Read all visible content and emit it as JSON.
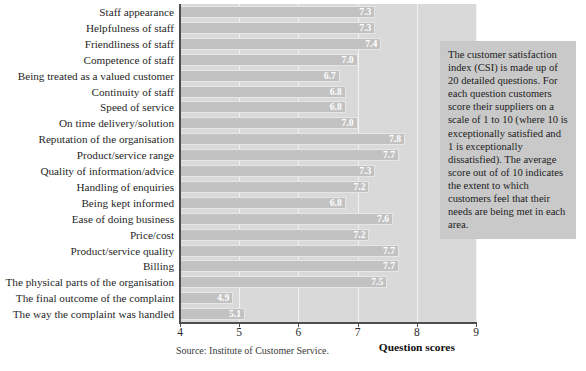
{
  "chart_data": {
    "type": "bar",
    "orientation": "horizontal",
    "title": "",
    "xlabel": "Question scores",
    "ylabel": "",
    "xlim": [
      4,
      9
    ],
    "xticks": [
      4,
      5,
      6,
      7,
      8,
      9
    ],
    "xtick_labels": [
      "4",
      "5",
      "6",
      "7",
      "8",
      "9"
    ],
    "grid": true,
    "legend": null,
    "categories": [
      "Staff appearance",
      "Helpfulness of staff",
      "Friendliness of staff",
      "Competence of staff",
      "Being treated as a valued customer",
      "Continuity of staff",
      "Speed of service",
      "On time delivery/solution",
      "Reputation of the organisation",
      "Product/service range",
      "Quality of information/advice",
      "Handling of enquiries",
      "Being kept informed",
      "Ease of doing business",
      "Price/cost",
      "Product/service quality",
      "Billing",
      "The physical parts of the organisation",
      "The final outcome of the complaint",
      "The way the complaint was handled"
    ],
    "values": [
      7.3,
      7.3,
      7.4,
      7.0,
      6.7,
      6.8,
      6.8,
      7.0,
      7.8,
      7.7,
      7.3,
      7.2,
      6.8,
      7.6,
      7.2,
      7.7,
      7.7,
      7.5,
      4.9,
      5.1
    ],
    "value_labels": [
      "7.3",
      "7.3",
      "7.4",
      "7.0",
      "6.7",
      "6.8",
      "6.8",
      "7.0",
      "7.8",
      "7.7",
      "7.3",
      "7.2",
      "6.8",
      "7.6",
      "7.2",
      "7.7",
      "7.7",
      "7.5",
      "4.9",
      "5.1"
    ],
    "bar_color": "#c2c2c2",
    "plot_background": "#d9d9d9",
    "value_label_color": "#ffffff"
  },
  "annotation": {
    "text": "The customer satisfaction index (CSI) is made up of 20 detailed questions. For each question customers score their suppliers on a scale of 1 to 10 (where 10 is exceptionally satisfied and 1 is exceptionally dissatisfied). The average score out of of 10 indicates the extent to which customers feel that their needs are being met in each area.",
    "background": "#c9c9c9"
  },
  "footer": {
    "source": "Source: Institute of Customer Service."
  }
}
